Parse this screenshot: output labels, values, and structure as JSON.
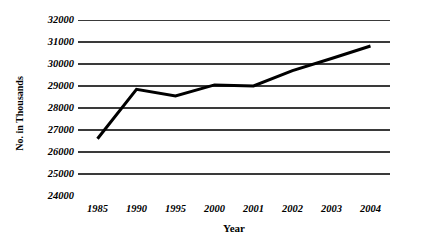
{
  "chart_data": {
    "type": "line",
    "title": "",
    "xlabel": "Year",
    "ylabel": "No. in Thousands",
    "categories": [
      "1985",
      "1990",
      "1995",
      "2000",
      "2001",
      "2002",
      "2003",
      "2004"
    ],
    "values": [
      26600,
      28850,
      28550,
      29050,
      29000,
      29700,
      30250,
      30820
    ],
    "series": [
      {
        "name": "",
        "values": [
          26600,
          28850,
          28550,
          29050,
          29000,
          29700,
          30250,
          30820
        ]
      }
    ],
    "ylim": [
      24000,
      32000
    ],
    "ytick_values": [
      32000,
      31000,
      30000,
      29000,
      28000,
      27000,
      26000,
      25000,
      24000
    ],
    "ytick_labels": [
      "32000",
      "31000",
      "30000",
      "29000",
      "28000",
      "27000",
      "26000",
      "25000",
      "24000"
    ],
    "xtick_labels": [
      "1985",
      "1990",
      "1995",
      "2000",
      "2001",
      "2002",
      "2003",
      "2004"
    ],
    "grid": "horizontal",
    "legend": "none",
    "line_color": "#000000",
    "gridline_color": "#3a3a3a",
    "axis_color": "#a8a8a8",
    "background_color": "#ffffff",
    "line_width": 3
  }
}
